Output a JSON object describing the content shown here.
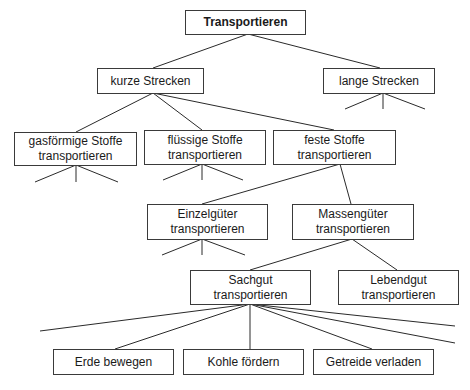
{
  "diagram": {
    "type": "tree",
    "root": {
      "label": "Transportieren"
    },
    "nodes": {
      "kurze": {
        "line1": "kurze Strecken"
      },
      "lange": {
        "line1": "lange Strecken"
      },
      "gas": {
        "line1": "gasförmige Stoffe",
        "line2": "transportieren"
      },
      "fluessig": {
        "line1": "flüssige Stoffe",
        "line2": "transportieren"
      },
      "fest": {
        "line1": "feste Stoffe",
        "line2": "transportieren"
      },
      "einzel": {
        "line1": "Einzelgüter",
        "line2": "transportieren"
      },
      "massen": {
        "line1": "Massengüter",
        "line2": "transportieren"
      },
      "sach": {
        "line1": "Sachgut",
        "line2": "transportieren"
      },
      "lebend": {
        "line1": "Lebendgut",
        "line2": "transportieren"
      },
      "erde": {
        "line1": "Erde bewegen"
      },
      "kohle": {
        "line1": "Kohle fördern"
      },
      "getreide": {
        "line1": "Getreide verladen"
      }
    },
    "edges": [
      [
        "Transportieren",
        "kurze Strecken"
      ],
      [
        "Transportieren",
        "lange Strecken"
      ],
      [
        "kurze Strecken",
        "gasförmige Stoffe transportieren"
      ],
      [
        "kurze Strecken",
        "flüssige Stoffe transportieren"
      ],
      [
        "kurze Strecken",
        "feste Stoffe transportieren"
      ],
      [
        "feste Stoffe transportieren",
        "Einzelgüter transportieren"
      ],
      [
        "feste Stoffe transportieren",
        "Massengüter transportieren"
      ],
      [
        "Massengüter transportieren",
        "Sachgut transportieren"
      ],
      [
        "Massengüter transportieren",
        "Lebendgut transportieren"
      ],
      [
        "Sachgut transportieren",
        "Erde bewegen"
      ],
      [
        "Sachgut transportieren",
        "Kohle fördern"
      ],
      [
        "Sachgut transportieren",
        "Getreide verladen"
      ]
    ]
  }
}
